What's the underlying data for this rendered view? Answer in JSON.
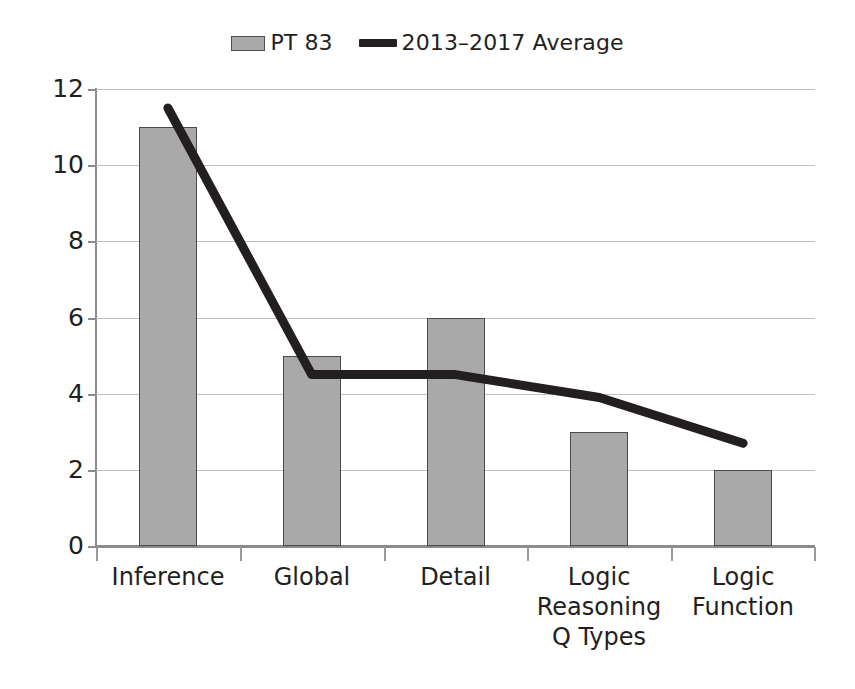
{
  "legend": {
    "entries": [
      {
        "label": "PT 83",
        "marker": "bar-swatch",
        "color": "#a9a9a9"
      },
      {
        "label": "2013–2017 Average",
        "marker": "line-swatch",
        "color": "#231f20"
      }
    ]
  },
  "axis": {
    "y_ticks": [
      "12",
      "10",
      "8",
      "6",
      "4",
      "2",
      "0"
    ],
    "x_labels": [
      "Inference",
      "Global",
      "Detail",
      "Logic Reasoning Q Types",
      "Logic Function"
    ]
  },
  "colors": {
    "bar_fill": "#a9a9a9",
    "bar_stroke": "#4a4a4a",
    "line": "#231f20",
    "gridline": "#bfbfbf",
    "axis": "#8c8c8c",
    "background": "#ffffff",
    "text": "#231f20"
  },
  "chart_data": {
    "type": "bar",
    "title": "",
    "subtitle": "",
    "xlabel": "",
    "ylabel": "",
    "ylim": [
      0,
      12
    ],
    "ytick_values": [
      0,
      2,
      4,
      6,
      8,
      10,
      12
    ],
    "grid": true,
    "legend_position": "top-center",
    "categories": [
      "Inference",
      "Global",
      "Detail",
      "Logic Reasoning Q Types",
      "Logic Function"
    ],
    "series": [
      {
        "name": "PT 83",
        "type": "bar",
        "color": "#a9a9a9",
        "values": [
          11,
          5,
          6,
          3,
          2
        ]
      },
      {
        "name": "2013–2017 Average",
        "type": "line",
        "color": "#231f20",
        "values": [
          11.5,
          4.5,
          4.5,
          3.9,
          2.7
        ]
      }
    ]
  }
}
